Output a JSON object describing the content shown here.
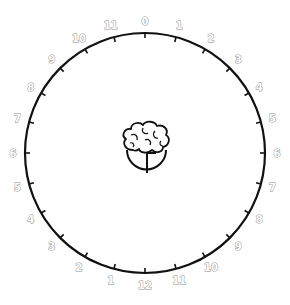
{
  "dial": {
    "center": [
      145,
      153
    ],
    "radius": 120,
    "label_radius": 132,
    "ring_color": "#111111",
    "label_color": "#8a8a8a",
    "step_degrees": 15,
    "labels": [
      {
        "text": "0",
        "angle": 0
      },
      {
        "text": "1",
        "angle": 15
      },
      {
        "text": "2",
        "angle": 30
      },
      {
        "text": "3",
        "angle": 45
      },
      {
        "text": "4",
        "angle": 60
      },
      {
        "text": "5",
        "angle": 75
      },
      {
        "text": "6",
        "angle": 90
      },
      {
        "text": "7",
        "angle": 105
      },
      {
        "text": "8",
        "angle": 120
      },
      {
        "text": "9",
        "angle": 135
      },
      {
        "text": "10",
        "angle": 150
      },
      {
        "text": "11",
        "angle": 165
      },
      {
        "text": "12",
        "angle": 180
      },
      {
        "text": "1",
        "angle": 195
      },
      {
        "text": "2",
        "angle": 210
      },
      {
        "text": "3",
        "angle": 225
      },
      {
        "text": "4",
        "angle": 240
      },
      {
        "text": "5",
        "angle": 255
      },
      {
        "text": "6",
        "angle": 270
      },
      {
        "text": "7",
        "angle": 285
      },
      {
        "text": "8",
        "angle": 300
      },
      {
        "text": "9",
        "angle": 315
      },
      {
        "text": "10",
        "angle": 330
      },
      {
        "text": "11",
        "angle": 345
      }
    ]
  },
  "center_icon": {
    "name": "brain-clock-icon",
    "clock_hands": {
      "minute": "12",
      "hour": "3"
    }
  }
}
